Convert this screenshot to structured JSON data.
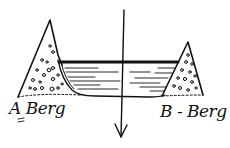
{
  "diagram": {
    "type": "hand-drawn sketch",
    "labels": {
      "left_mountain": "A Berg",
      "right_mountain": "B - Berg"
    },
    "elements": [
      {
        "id": "mountain-a",
        "kind": "triangle-with-pebbles"
      },
      {
        "id": "mountain-b",
        "kind": "triangle-with-pebbles"
      },
      {
        "id": "water-basin",
        "kind": "basin with water surface line and horizontal hatching"
      },
      {
        "id": "vertical-arrow",
        "kind": "arrow pointing down"
      }
    ],
    "colors": {
      "ink": "#111111",
      "background": "#ffffff"
    }
  }
}
